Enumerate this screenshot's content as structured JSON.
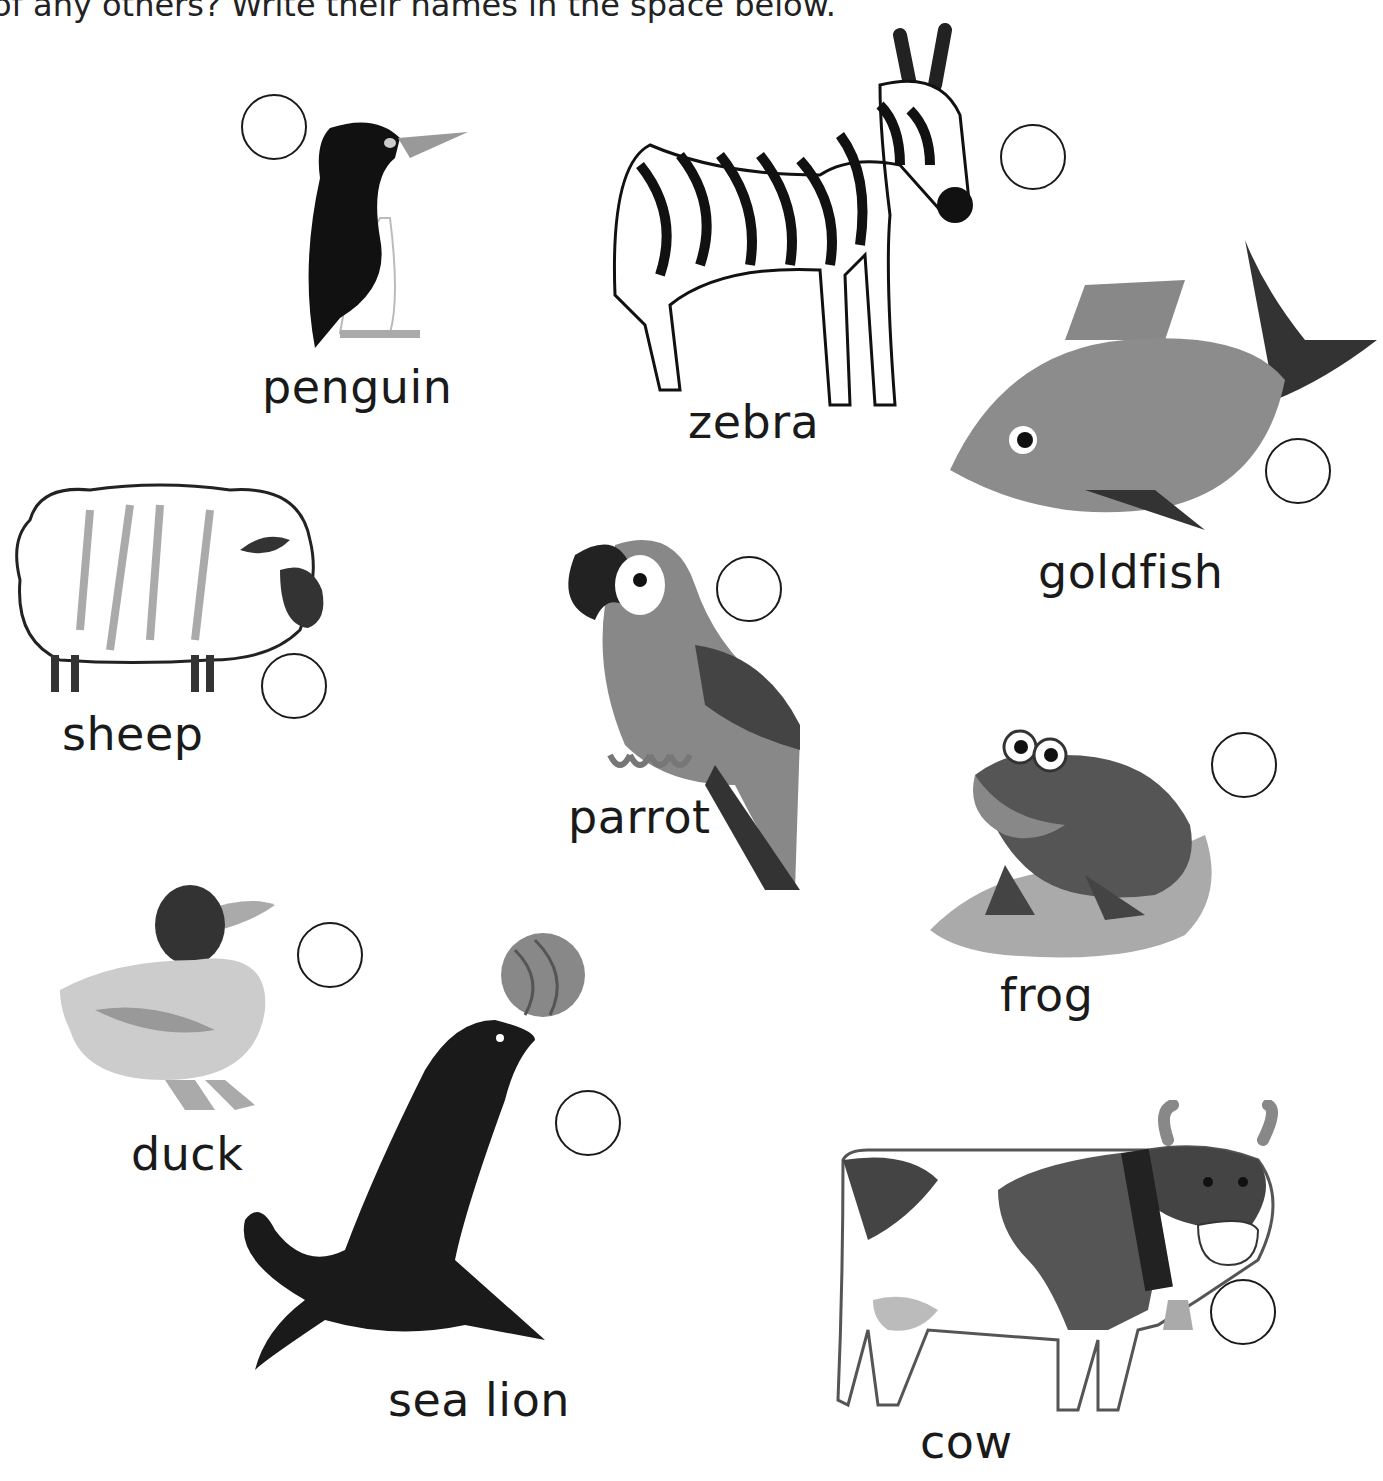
{
  "instruction": "of any others? Write their names in the space below.",
  "animals": [
    {
      "id": "penguin",
      "label": "penguin"
    },
    {
      "id": "zebra",
      "label": "zebra"
    },
    {
      "id": "goldfish",
      "label": "goldfish"
    },
    {
      "id": "sheep",
      "label": "sheep"
    },
    {
      "id": "parrot",
      "label": "parrot"
    },
    {
      "id": "frog",
      "label": "frog"
    },
    {
      "id": "duck",
      "label": "duck"
    },
    {
      "id": "sea-lion",
      "label": "sea lion"
    },
    {
      "id": "cow",
      "label": "cow"
    }
  ]
}
